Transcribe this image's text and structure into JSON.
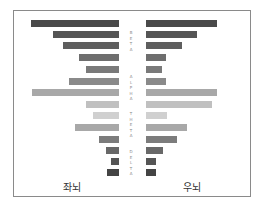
{
  "chart_data": {
    "type": "bar",
    "orientation": "horizontal-mirrored",
    "title": "",
    "bands": [
      {
        "name": "BETA",
        "rows": [
          0,
          1,
          2,
          3
        ]
      },
      {
        "name": "ALPHA",
        "rows": [
          4,
          5,
          6,
          7
        ]
      },
      {
        "name": "THETA",
        "rows": [
          8,
          9,
          10
        ]
      },
      {
        "name": "DELTA",
        "rows": [
          11,
          12,
          13
        ]
      }
    ],
    "series": [
      {
        "name": "좌뇌",
        "side": "left",
        "values": [
          88,
          66,
          56,
          40,
          33,
          50,
          87,
          33,
          26,
          44,
          20,
          13,
          8,
          12
        ]
      },
      {
        "name": "우뇌",
        "side": "right",
        "values": [
          71,
          51,
          36,
          20,
          16,
          20,
          71,
          66,
          21,
          41,
          31,
          17,
          10,
          10
        ]
      }
    ],
    "colors": [
      "#4a4a4a",
      "#555555",
      "#5e5e5e",
      "#6e6e6e",
      "#7a7a7a",
      "#8a8a8a",
      "#a8a8a8",
      "#c0c0c0",
      "#d0d0d0",
      "#a8a8a8",
      "#7c7c7c",
      "#686868",
      "#555555",
      "#444444"
    ],
    "xlabel": "",
    "ylabel": "",
    "grid": false,
    "legend": "none"
  },
  "labels": {
    "left": "좌뇌",
    "right": "우뇌",
    "beta": "B E T A",
    "alpha": "A L P H A",
    "theta": "T H E T A",
    "delta": "D E L T A"
  }
}
